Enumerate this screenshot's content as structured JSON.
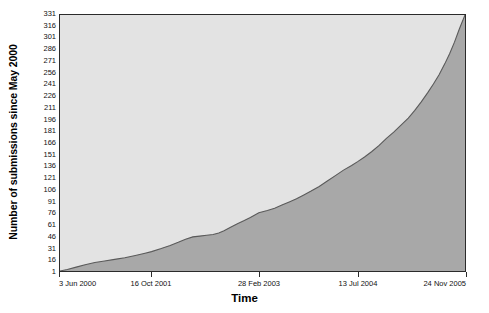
{
  "chart_data": {
    "type": "area",
    "title": "",
    "xlabel": "Time",
    "ylabel": "Number of submissions since May 2000",
    "grid": false,
    "legend": "none",
    "ylim": [
      1,
      331
    ],
    "yticks": [
      1,
      16,
      31,
      46,
      61,
      76,
      91,
      106,
      121,
      136,
      151,
      166,
      181,
      196,
      211,
      226,
      241,
      256,
      271,
      286,
      301,
      316,
      331
    ],
    "xticks": [
      "3 Jun 2000",
      "16 Oct 2001",
      "28 Feb 2003",
      "13 Jul 2004",
      "24 Nov 2005"
    ],
    "xtick_fractions": [
      0.0,
      0.226,
      0.4914,
      0.7346,
      1.0
    ],
    "series": [
      {
        "name": "Cumulative submissions",
        "x_fraction": [
          0.0,
          0.018,
          0.04,
          0.062,
          0.086,
          0.11,
          0.135,
          0.16,
          0.186,
          0.21,
          0.226,
          0.25,
          0.272,
          0.292,
          0.31,
          0.328,
          0.345,
          0.362,
          0.378,
          0.392,
          0.405,
          0.42,
          0.438,
          0.455,
          0.47,
          0.491,
          0.512,
          0.53,
          0.548,
          0.566,
          0.584,
          0.602,
          0.62,
          0.64,
          0.66,
          0.68,
          0.7,
          0.72,
          0.735,
          0.752,
          0.77,
          0.788,
          0.806,
          0.824,
          0.842,
          0.86,
          0.876,
          0.892,
          0.908,
          0.922,
          0.936,
          0.95,
          0.962,
          0.974,
          0.986,
          1.0
        ],
        "values": [
          1,
          3,
          6,
          9,
          12,
          14,
          16,
          18,
          21,
          24,
          26,
          30,
          34,
          38,
          42,
          45,
          46,
          47,
          48,
          50,
          53,
          57,
          62,
          66,
          70,
          76,
          79,
          82,
          86,
          90,
          94,
          99,
          104,
          110,
          117,
          124,
          131,
          137,
          142,
          148,
          155,
          163,
          172,
          180,
          189,
          198,
          208,
          219,
          231,
          242,
          254,
          268,
          281,
          296,
          313,
          331
        ]
      }
    ],
    "colors": {
      "plot_background": "#e3e3e3",
      "area_fill": "#a8a8a8",
      "area_line": "#5a5a5a",
      "frame": "#2b2b2b",
      "text": "#111111",
      "page_background": "#ffffff"
    }
  }
}
